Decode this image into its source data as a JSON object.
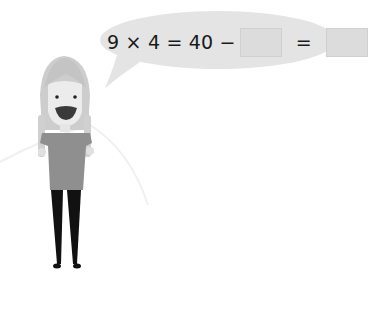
{
  "speech_bubble": {
    "expression_left": "9 × 4 = 40 −",
    "blank_1": "",
    "equals": "=",
    "blank_2": ""
  },
  "colors": {
    "bubble": "#e4e4e4",
    "answer_box": "#dcdcdc",
    "hair": "#c8c8c8",
    "skin": "#ececec",
    "shirt": "#8f8f8f",
    "legs": "#111111",
    "mouth": "#3a3a3a"
  }
}
